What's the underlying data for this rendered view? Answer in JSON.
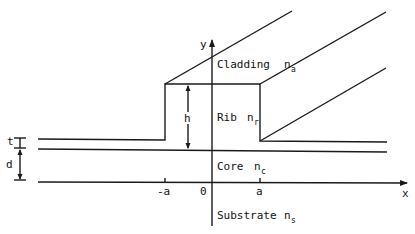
{
  "diagram": {
    "type": "rib-waveguide-cross-section",
    "axes": {
      "x_label": "x",
      "y_label": "y",
      "origin_label": "0",
      "x_ticks": [
        "-a",
        "a"
      ]
    },
    "regions": [
      {
        "name": "Cladding",
        "index_symbol": "n",
        "index_subscript": "a"
      },
      {
        "name": "Rib",
        "index_symbol": "n",
        "index_subscript": "r"
      },
      {
        "name": "Core",
        "index_symbol": "n",
        "index_subscript": "c"
      },
      {
        "name": "Substrate",
        "index_symbol": "n",
        "index_subscript": "s"
      }
    ],
    "dimensions": {
      "rib_height": "h",
      "slab_thickness": "t",
      "core_thickness": "d"
    }
  }
}
